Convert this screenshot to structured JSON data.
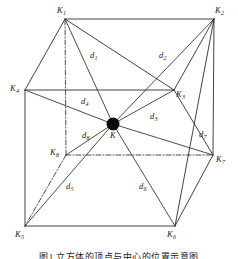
{
  "figure": {
    "type": "geometric-diagram",
    "caption": "图1  立方体的顶点与中心的位置示意图",
    "background_color": "#ffffff",
    "line_color": "#2c2c2c",
    "center_dot_color": "#0b0b0b"
  },
  "vertices": [
    {
      "id": "K1",
      "label": "K",
      "sub": "1",
      "x": 65,
      "y": 19,
      "label_x": 57,
      "label_y": 6,
      "hidden": false
    },
    {
      "id": "K2",
      "label": "K",
      "sub": "2",
      "x": 214,
      "y": 19,
      "label_x": 215,
      "label_y": 6,
      "hidden": false
    },
    {
      "id": "K3",
      "label": "K",
      "sub": "3",
      "x": 174,
      "y": 90,
      "label_x": 176,
      "label_y": 90,
      "hidden": false
    },
    {
      "id": "K4",
      "label": "K",
      "sub": "4",
      "x": 25,
      "y": 90,
      "label_x": 10,
      "label_y": 84,
      "hidden": false
    },
    {
      "id": "K5",
      "label": "K",
      "sub": "5",
      "x": 25,
      "y": 226,
      "label_x": 15,
      "label_y": 230,
      "hidden": false
    },
    {
      "id": "K6",
      "label": "K",
      "sub": "6",
      "x": 175,
      "y": 226,
      "label_x": 167,
      "label_y": 230,
      "hidden": false
    },
    {
      "id": "K7",
      "label": "K",
      "sub": "7",
      "x": 213,
      "y": 155,
      "label_x": 216,
      "label_y": 155,
      "hidden": false
    },
    {
      "id": "K8",
      "label": "K",
      "sub": "8",
      "x": 66,
      "y": 155,
      "label_x": 50,
      "label_y": 148,
      "hidden": true
    }
  ],
  "center": {
    "id": "K",
    "label": "K",
    "sub": "",
    "x": 113,
    "y": 124,
    "radius": 6.5,
    "label_x": 110,
    "label_y": 131
  },
  "distance_labels": [
    {
      "id": "d1",
      "label": "d",
      "sub": "1",
      "x": 90,
      "y": 51
    },
    {
      "id": "d2",
      "label": "d",
      "sub": "2",
      "x": 159,
      "y": 51
    },
    {
      "id": "d3",
      "label": "d",
      "sub": "3",
      "x": 150,
      "y": 112
    },
    {
      "id": "d4",
      "label": "d",
      "sub": "4",
      "x": 81,
      "y": 97
    },
    {
      "id": "d5",
      "label": "d",
      "sub": "5",
      "x": 66,
      "y": 182
    },
    {
      "id": "d6",
      "label": "d",
      "sub": "6",
      "x": 139,
      "y": 182
    },
    {
      "id": "d7",
      "label": "d",
      "sub": "7",
      "x": 199,
      "y": 130
    },
    {
      "id": "d8",
      "label": "d",
      "sub": "8",
      "x": 82,
      "y": 131
    }
  ],
  "edges_solid": [
    {
      "from": "K1",
      "to": "K2"
    },
    {
      "from": "K1",
      "to": "K4"
    },
    {
      "from": "K2",
      "to": "K3"
    },
    {
      "from": "K2",
      "to": "K7"
    },
    {
      "from": "K3",
      "to": "K4"
    },
    {
      "from": "K4",
      "to": "K5"
    },
    {
      "from": "K5",
      "to": "K6"
    },
    {
      "from": "K6",
      "to": "K7"
    },
    {
      "from": "K3",
      "to": "K7"
    },
    {
      "from": "K1",
      "to": "K3"
    },
    {
      "from": "K6",
      "to": "K2"
    }
  ],
  "edges_hidden": [
    {
      "from": "K8",
      "to": "K1"
    },
    {
      "from": "K8",
      "to": "K5"
    },
    {
      "from": "K8",
      "to": "K7"
    }
  ],
  "diagonals": [
    {
      "id": "d1",
      "from": "K1",
      "to": "K"
    },
    {
      "id": "d2",
      "from": "K2",
      "to": "K"
    },
    {
      "id": "d3",
      "from": "K3",
      "to": "K"
    },
    {
      "id": "d4",
      "from": "K4",
      "to": "K"
    },
    {
      "id": "d5",
      "from": "K5",
      "to": "K"
    },
    {
      "id": "d6",
      "from": "K6",
      "to": "K"
    },
    {
      "id": "d7",
      "from": "K7",
      "to": "K"
    },
    {
      "id": "d8",
      "from": "K8",
      "to": "K"
    }
  ]
}
